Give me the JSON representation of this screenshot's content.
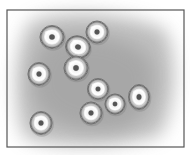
{
  "figure": {
    "frame": {
      "x": 7,
      "y": 10,
      "width": 177,
      "height": 137,
      "stroke": "#555555"
    },
    "background": {
      "paper": "#ffffff",
      "smudge": "#9a9a9a"
    },
    "cells": [
      {
        "cx": 52,
        "cy": 37,
        "rx": 12,
        "ry": 11.5,
        "rot": 0
      },
      {
        "cx": 97,
        "cy": 32,
        "rx": 11,
        "ry": 11,
        "rot": 0
      },
      {
        "cx": 78,
        "cy": 47,
        "rx": 12.5,
        "ry": 11,
        "rot": 20
      },
      {
        "cx": 76,
        "cy": 68,
        "rx": 12,
        "ry": 12,
        "rot": 0
      },
      {
        "cx": 39,
        "cy": 74,
        "rx": 11,
        "ry": 11.5,
        "rot": 0
      },
      {
        "cx": 98,
        "cy": 89,
        "rx": 10.5,
        "ry": 10.5,
        "rot": 0
      },
      {
        "cx": 139,
        "cy": 97,
        "rx": 10.5,
        "ry": 12.5,
        "rot": 0
      },
      {
        "cx": 115,
        "cy": 104,
        "rx": 10,
        "ry": 10,
        "rot": 0
      },
      {
        "cx": 91,
        "cy": 113,
        "rx": 11,
        "ry": 11,
        "rot": 0
      },
      {
        "cx": 41,
        "cy": 123,
        "rx": 11,
        "ry": 11.5,
        "rot": 0
      }
    ]
  }
}
